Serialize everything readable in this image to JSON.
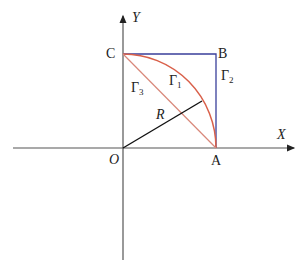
{
  "diagram": {
    "axes": {
      "x_label": "X",
      "y_label": "Y",
      "origin_label": "O"
    },
    "points": {
      "A": "A",
      "B": "B",
      "C": "C"
    },
    "curves": {
      "gamma1": {
        "symbol": "Γ",
        "sub": "1",
        "description": "quarter-circle arc from C to A"
      },
      "gamma2": {
        "symbol": "Γ",
        "sub": "2",
        "description": "path C → B → A"
      },
      "gamma3": {
        "symbol": "Γ",
        "sub": "3",
        "description": "straight segment C → A"
      }
    },
    "radius_label": "R",
    "colors": {
      "arc": "#d9604a",
      "square": "#3a3f9a",
      "chord": "#d9604a",
      "radius": "#111111",
      "axis": "#333333"
    }
  }
}
